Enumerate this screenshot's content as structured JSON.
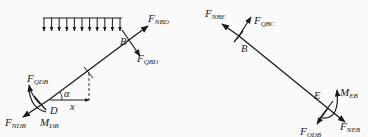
{
  "diagram": {
    "type": "free-body-diagram",
    "colors": {
      "line": "#1a1a1a",
      "background": "#fbfbfb"
    },
    "left_member": {
      "name": "BD",
      "points": {
        "B": "B",
        "D": "D"
      },
      "distributed_load": {
        "arrows": 11,
        "direction": "down"
      },
      "forces": [
        {
          "id": "F_NBD",
          "base": "F",
          "sub": "NBD"
        },
        {
          "id": "F_QBD",
          "base": "F",
          "sub": "QBD"
        },
        {
          "id": "F_QDB",
          "base": "F",
          "sub": "QDB"
        },
        {
          "id": "F_NDB",
          "base": "F",
          "sub": "NDB"
        }
      ],
      "moments": [
        {
          "id": "M_DB",
          "base": "M",
          "sub": "DB"
        }
      ],
      "angle_label": "α",
      "x_label": "x"
    },
    "right_member": {
      "name": "BE",
      "points": {
        "B": "B",
        "E": "E"
      },
      "forces": [
        {
          "id": "F_NBE",
          "base": "F",
          "sub": "NBE"
        },
        {
          "id": "F_QBC",
          "base": "F",
          "sub": "QBC"
        },
        {
          "id": "F_QDB",
          "base": "F",
          "sub": "QDB"
        },
        {
          "id": "F_NEB",
          "base": "F",
          "sub": "NEB"
        }
      ],
      "moments": [
        {
          "id": "M_EB",
          "base": "M",
          "sub": "EB"
        }
      ]
    }
  }
}
